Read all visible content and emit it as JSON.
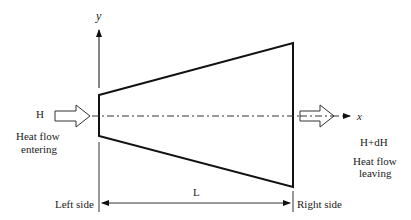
{
  "diagram": {
    "type": "fin-heat-flow-schematic",
    "axes": {
      "y_label": "y",
      "x_label": "x"
    },
    "inlet": {
      "symbol": "H",
      "caption_line1": "Heat flow",
      "caption_line2": "entering"
    },
    "outlet": {
      "symbol": "H+dH",
      "caption_line1": "Heat flow",
      "caption_line2": "leaving"
    },
    "dimension": {
      "label": "L"
    },
    "sides": {
      "left": "Left side",
      "right": "Right side"
    },
    "colors": {
      "stroke": "#111111",
      "text": "#222222",
      "background": "#ffffff"
    }
  }
}
